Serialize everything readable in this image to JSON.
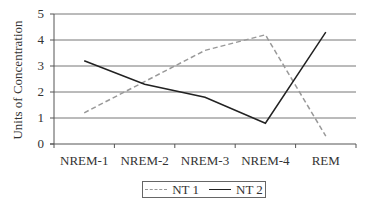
{
  "chart_data": {
    "type": "line",
    "title": "",
    "xlabel": "",
    "ylabel": "Units of Concentration",
    "categories": [
      "NREM-1",
      "NREM-2",
      "NREM-3",
      "NREM-4",
      "REM"
    ],
    "series": [
      {
        "name": "NT 1",
        "values": [
          1.2,
          2.4,
          3.6,
          4.2,
          0.3
        ],
        "color": "#999999",
        "style": "dashed"
      },
      {
        "name": "NT 2",
        "values": [
          3.2,
          2.3,
          1.8,
          0.8,
          4.3
        ],
        "color": "#222222",
        "style": "solid"
      }
    ],
    "ylim": [
      0,
      5
    ],
    "yticks": [
      0,
      1,
      2,
      3,
      4,
      5
    ],
    "grid": true,
    "legend_position": "bottom"
  },
  "legend": {
    "items": [
      {
        "label": "NT 1"
      },
      {
        "label": "NT 2"
      }
    ]
  }
}
